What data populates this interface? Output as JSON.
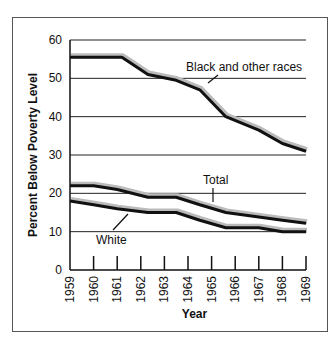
{
  "chart_data": {
    "type": "line",
    "title": "",
    "xlabel": "Year",
    "ylabel": "Percent Below Poverty Level",
    "ylim": [
      0,
      60
    ],
    "yticks": [
      0,
      10,
      20,
      30,
      40,
      50,
      60
    ],
    "xticks": [
      "1959",
      "1960",
      "1961",
      "1962",
      "1963",
      "1964",
      "1965",
      "1966",
      "1967",
      "1968",
      "1969"
    ],
    "grid": true,
    "legend": "inline labels",
    "series": [
      {
        "name": "Black and other races",
        "points": [
          [
            1959,
            55.5
          ],
          [
            1960,
            55.5
          ],
          [
            1961.2,
            55.5
          ],
          [
            1962.3,
            51
          ],
          [
            1963.5,
            49.5
          ],
          [
            1964.5,
            47
          ],
          [
            1965.6,
            40
          ],
          [
            1967,
            36.5
          ],
          [
            1968,
            33
          ],
          [
            1969,
            31
          ]
        ]
      },
      {
        "name": "Total",
        "points": [
          [
            1959,
            22
          ],
          [
            1960,
            22
          ],
          [
            1961,
            21
          ],
          [
            1962.3,
            19
          ],
          [
            1963.5,
            19
          ],
          [
            1964.5,
            17
          ],
          [
            1965.6,
            15
          ],
          [
            1967,
            13.8
          ],
          [
            1968,
            13
          ],
          [
            1969,
            12.2
          ]
        ]
      },
      {
        "name": "White",
        "points": [
          [
            1959,
            18
          ],
          [
            1960,
            17
          ],
          [
            1961,
            16
          ],
          [
            1962.3,
            15
          ],
          [
            1963.5,
            15
          ],
          [
            1964.5,
            13
          ],
          [
            1965.6,
            11
          ],
          [
            1967,
            11
          ],
          [
            1968,
            10
          ],
          [
            1969,
            10
          ]
        ]
      }
    ]
  },
  "labels": {
    "ylabel": "Percent Below Poverty Level",
    "xlabel": "Year",
    "black": "Black and other races",
    "total": "Total",
    "white": "White",
    "y": [
      "0",
      "10",
      "20",
      "30",
      "40",
      "50",
      "60"
    ],
    "x": [
      "1959",
      "1960",
      "1961",
      "1962",
      "1963",
      "1964",
      "1965",
      "1966",
      "1967",
      "1968",
      "1969"
    ]
  }
}
